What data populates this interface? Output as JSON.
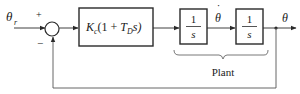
{
  "diagram": {
    "type": "control-block-diagram",
    "input": {
      "symbol": "θ",
      "subscript": "r"
    },
    "summing_junction": {
      "plus_sign": "+",
      "minus_sign": "−"
    },
    "controller": {
      "K": "K",
      "K_sub": "c",
      "pre": "(1 + ",
      "T": "T",
      "T_sub": "D",
      "post": "s)"
    },
    "plant_blocks": [
      {
        "numerator": "1",
        "denominator": "s"
      },
      {
        "numerator": "1",
        "denominator": "s"
      }
    ],
    "intermediate_signal": "θ",
    "intermediate_dot": "˙",
    "output": {
      "symbol": "θ"
    },
    "brace_label": "Plant",
    "colors": {
      "line": "#2a2a2a",
      "text": "#1a1a1a",
      "feedback": "#555555"
    }
  }
}
